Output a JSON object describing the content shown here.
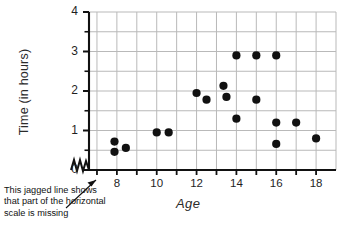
{
  "chart_data": {
    "type": "scatter",
    "title": "",
    "xlabel": "Age",
    "ylabel": "Time (in hours)",
    "xlim": [
      6.6,
      19.0
    ],
    "ylim": [
      0,
      4
    ],
    "xticks": [
      7,
      8,
      9,
      10,
      11,
      12,
      13,
      14,
      15,
      16,
      17,
      18
    ],
    "xtick_labels": [
      "",
      "8",
      "",
      "10",
      "",
      "12",
      "",
      "14",
      "",
      "16",
      "",
      "18"
    ],
    "yticks": [
      0,
      0.5,
      1,
      1.5,
      2,
      2.5,
      3,
      3.5,
      4
    ],
    "ytick_labels": [
      "0",
      "",
      "1",
      "",
      "2",
      "",
      "3",
      "",
      "4"
    ],
    "grid": true,
    "grid_color": "#b9b9b9",
    "legend": null,
    "marker": "filled-circle",
    "marker_color": "#111111",
    "marker_size": 7,
    "axis_break": "jagged-line-on-x-axis",
    "points": [
      {
        "x": 7.88,
        "y": 0.72
      },
      {
        "x": 7.88,
        "y": 0.46
      },
      {
        "x": 8.45,
        "y": 0.56
      },
      {
        "x": 10.0,
        "y": 0.95
      },
      {
        "x": 10.6,
        "y": 0.95
      },
      {
        "x": 12.0,
        "y": 1.95
      },
      {
        "x": 12.5,
        "y": 1.78
      },
      {
        "x": 13.35,
        "y": 2.13
      },
      {
        "x": 13.5,
        "y": 1.85
      },
      {
        "x": 14.0,
        "y": 2.9
      },
      {
        "x": 14.0,
        "y": 1.3
      },
      {
        "x": 15.0,
        "y": 2.9
      },
      {
        "x": 15.0,
        "y": 1.78
      },
      {
        "x": 16.0,
        "y": 2.9
      },
      {
        "x": 16.0,
        "y": 1.2
      },
      {
        "x": 16.0,
        "y": 0.66
      },
      {
        "x": 17.0,
        "y": 1.2
      },
      {
        "x": 18.0,
        "y": 0.8
      }
    ]
  },
  "annotation": {
    "text": "This jagged line shows that part of the horizontal scale is missing"
  }
}
